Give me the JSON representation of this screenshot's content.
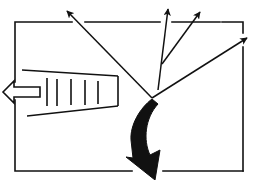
{
  "diagram": {
    "type": "line-art schematic",
    "colors": {
      "stroke": "#111111",
      "background": "#ffffff"
    },
    "box": {
      "x": 16,
      "y": 22,
      "width": 231,
      "height": 149
    },
    "radiating_arrows": {
      "origin": [
        152,
        98
      ],
      "count": 4,
      "tips": [
        [
          66,
          10
        ],
        [
          168,
          9
        ],
        [
          200,
          12
        ],
        [
          247,
          38
        ]
      ]
    },
    "tapered_beam": {
      "hatch_line_count": 5
    },
    "hollow_arrow": {
      "direction": "left"
    },
    "curved_arrow": {
      "direction": "down",
      "style": "thick filled"
    }
  }
}
